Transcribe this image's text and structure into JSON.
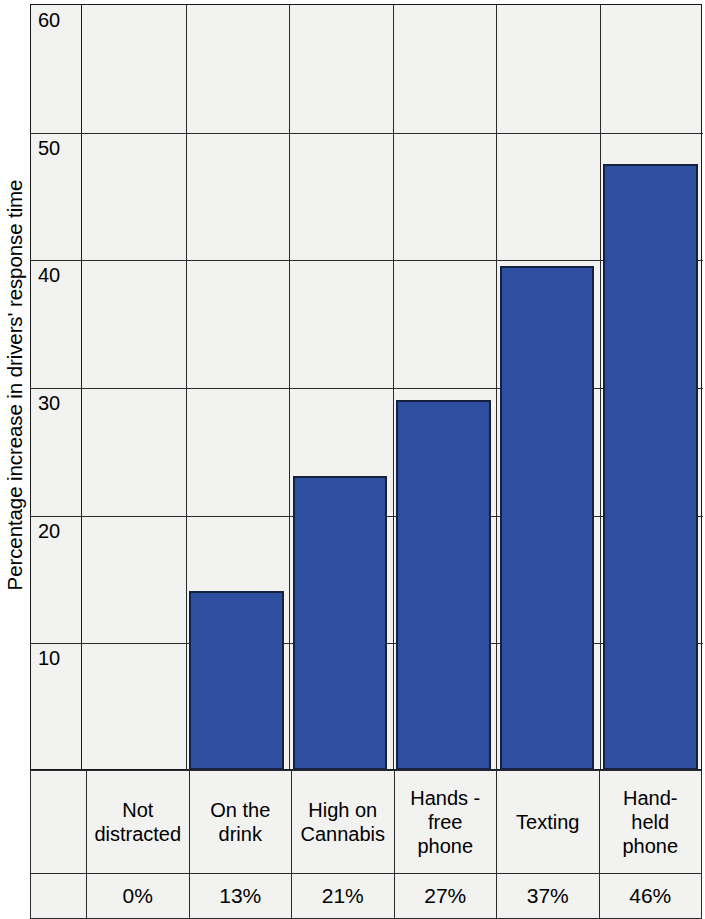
{
  "chart_data": {
    "type": "bar",
    "title": "",
    "xlabel": "",
    "ylabel": "Percentage increase in drivers' response time",
    "ylim": [
      0,
      60
    ],
    "yticks": [
      10,
      20,
      30,
      40,
      50,
      60
    ],
    "grid": true,
    "legend": "none",
    "categories": [
      "Not distracted",
      "On the drink",
      "High on Cannabis",
      "Hands - free phone",
      "Texting",
      "Hand-held phone"
    ],
    "category_lines": [
      [
        "Not",
        "distracted"
      ],
      [
        "On the",
        "drink"
      ],
      [
        "High on",
        "Cannabis"
      ],
      [
        "Hands -",
        "free",
        "phone"
      ],
      [
        "Texting"
      ],
      [
        "Hand-",
        "held",
        "phone"
      ]
    ],
    "values": [
      0,
      13,
      21,
      27,
      37,
      46
    ],
    "value_labels": [
      "0%",
      "13%",
      "21%",
      "27%",
      "37%",
      "46%"
    ],
    "plotted_heights": [
      0,
      14,
      23,
      29,
      39.5,
      47.5
    ],
    "bar_color": "#2E4FA0",
    "bar_border_color": "#16213f",
    "plot_background": "#F2F2F0",
    "gridline_color": "#2b2b2b"
  },
  "axis": {
    "tick_labels": [
      "60",
      "50",
      "40",
      "30",
      "20",
      "10"
    ]
  }
}
